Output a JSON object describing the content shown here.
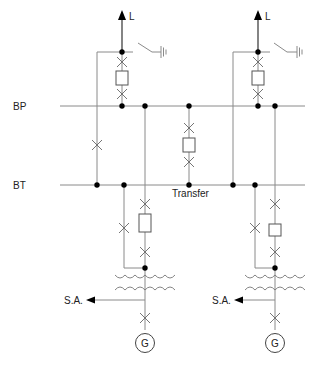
{
  "diagram": {
    "type": "single-line electrical substation diagram",
    "busbars": [
      {
        "id": "main-bus",
        "label": "BP"
      },
      {
        "id": "transfer-bus",
        "label": "BT"
      }
    ],
    "coupler": {
      "label": "Transfer"
    },
    "line_labels": {
      "left": "L",
      "right": "L"
    },
    "aux_labels": {
      "left": "S.A.",
      "right": "S.A."
    },
    "generator_labels": {
      "left": "G",
      "right": "G"
    },
    "colors": {
      "line": "#8a8a8a",
      "node": "#000000",
      "text": "#222222"
    }
  }
}
